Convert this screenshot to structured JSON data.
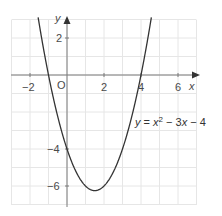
{
  "chart_data": {
    "type": "line",
    "title": "",
    "xlabel": "x",
    "ylabel": "y",
    "xlim": [
      -3,
      7
    ],
    "ylim": [
      -7,
      3
    ],
    "grid": true,
    "grid_step": 1,
    "x_ticks": [
      -2,
      2,
      4,
      6
    ],
    "y_ticks": [
      2,
      -4,
      -6
    ],
    "origin_label": "O",
    "series": [
      {
        "name": "y = x² − 3x − 4",
        "equation": "y = x^2 - 3x - 4",
        "x": [
          -1.9,
          -1.5,
          -1,
          -0.5,
          0,
          0.5,
          1,
          1.5,
          2,
          2.5,
          3,
          3.5,
          4,
          4.5,
          4.9
        ],
        "y": [
          5.31,
          2.75,
          0,
          -2.25,
          -4,
          -5.25,
          -6,
          -6.25,
          -6,
          -5.25,
          -4,
          -2.25,
          0,
          2.75,
          5.31
        ],
        "x_intercepts": [
          -1,
          4
        ],
        "y_intercept": -4,
        "vertex": [
          1.5,
          -6.25
        ]
      }
    ],
    "annotations": [
      {
        "text": "y = x² − 3x − 4",
        "position": "right of curve, near y = -3"
      }
    ]
  },
  "labels": {
    "x_axis": "x",
    "y_axis": "y",
    "origin": "O",
    "ticks_x": [
      "−2",
      "2",
      "4",
      "6"
    ],
    "ticks_y": [
      "2",
      "−4",
      "−6"
    ],
    "equation_prefix": "y",
    "equation_eq": " = ",
    "equation_x": "x",
    "equation_exp": "2",
    "equation_rest_op1": " − 3",
    "equation_rest_x": "x",
    "equation_rest_op2": " − 4"
  },
  "colors": {
    "grid": "#e6e6e6",
    "axis": "#7a7a7a",
    "curve": "#333333",
    "text": "#4a4a4a"
  }
}
